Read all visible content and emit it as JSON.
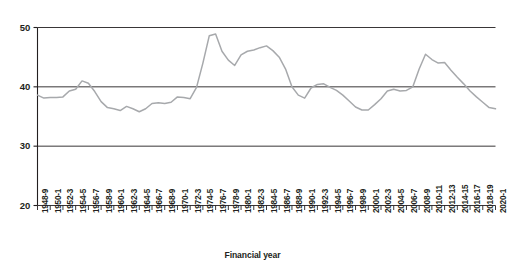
{
  "chart_data": {
    "type": "line",
    "title": "",
    "xlabel": "Financial year",
    "ylabel": "",
    "ylim": [
      20,
      50
    ],
    "yticks": [
      20,
      30,
      40,
      50
    ],
    "grid": true,
    "legend": null,
    "line_color": "#a7a9ac",
    "axis_color": "#231f20",
    "categories": [
      "1948-9",
      "1949-50",
      "1950-1",
      "1951-2",
      "1952-3",
      "1953-4",
      "1954-5",
      "1955-6",
      "1956-7",
      "1957-8",
      "1958-9",
      "1959-60",
      "1960-1",
      "1961-2",
      "1962-3",
      "1963-4",
      "1964-5",
      "1965-6",
      "1966-7",
      "1967-8",
      "1968-9",
      "1969-70",
      "1970-1",
      "1971-2",
      "1972-3",
      "1973-4",
      "1974-5",
      "1975-6",
      "1976-7",
      "1977-8",
      "1978-9",
      "1979-80",
      "1980-1",
      "1981-2",
      "1982-3",
      "1983-4",
      "1984-5",
      "1985-6",
      "1986-7",
      "1987-8",
      "1988-9",
      "1989-90",
      "1990-1",
      "1991-2",
      "1992-3",
      "1993-4",
      "1994-5",
      "1995-6",
      "1996-7",
      "1997-8",
      "1998-9",
      "1999-2000",
      "2000-1",
      "2001-2",
      "2002-3",
      "2003-4",
      "2004-5",
      "2005-6",
      "2006-7",
      "2007-8",
      "2008-9",
      "2009-10",
      "2010-11",
      "2011-12",
      "2012-13",
      "2013-14",
      "2014-15",
      "2015-16",
      "2016-17",
      "2017-18",
      "2018-19",
      "2019-20",
      "2020-1"
    ],
    "values": [
      38.6,
      38.1,
      38.2,
      38.2,
      38.3,
      39.3,
      39.6,
      41.0,
      40.6,
      39.2,
      37.5,
      36.5,
      36.3,
      36.0,
      36.7,
      36.3,
      35.8,
      36.3,
      37.2,
      37.3,
      37.2,
      37.4,
      38.3,
      38.2,
      38.0,
      39.9,
      44.0,
      48.6,
      48.9,
      46.0,
      44.5,
      43.6,
      45.4,
      46.0,
      46.2,
      46.6,
      46.9,
      46.1,
      45.0,
      43.0,
      40.0,
      38.6,
      38.1,
      39.8,
      40.4,
      40.5,
      39.9,
      39.4,
      38.6,
      37.6,
      36.6,
      36.1,
      36.1,
      37.0,
      38.0,
      39.3,
      39.6,
      39.3,
      39.4,
      40.0,
      43.0,
      45.5,
      44.6,
      44.0,
      44.1,
      42.8,
      41.6,
      40.5,
      39.3,
      38.3,
      37.4,
      36.5,
      36.3
    ],
    "xtick_labels": [
      "1948-9",
      "1950-1",
      "1952-3",
      "1954-5",
      "1956-7",
      "1958-9",
      "1960-1",
      "1962-3",
      "1964-5",
      "1966-7",
      "1968-9",
      "1970-1",
      "1972-3",
      "1974-5",
      "1976-7",
      "1978-9",
      "1980-1",
      "1982-3",
      "1984-5",
      "1986-7",
      "1988-9",
      "1990-1",
      "1992-3",
      "1994-5",
      "1996-7",
      "1998-9",
      "2000-1",
      "2002-3",
      "2004-5",
      "2006-7",
      "2008-9",
      "2010-11",
      "2012-13",
      "2014-15",
      "2016-17",
      "2018-19",
      "2020-1"
    ],
    "xtick_indices": [
      0,
      2,
      4,
      6,
      8,
      10,
      12,
      14,
      16,
      18,
      20,
      22,
      24,
      26,
      28,
      30,
      32,
      34,
      36,
      38,
      40,
      42,
      44,
      46,
      48,
      50,
      52,
      54,
      56,
      58,
      60,
      62,
      64,
      66,
      68,
      70,
      72
    ]
  }
}
